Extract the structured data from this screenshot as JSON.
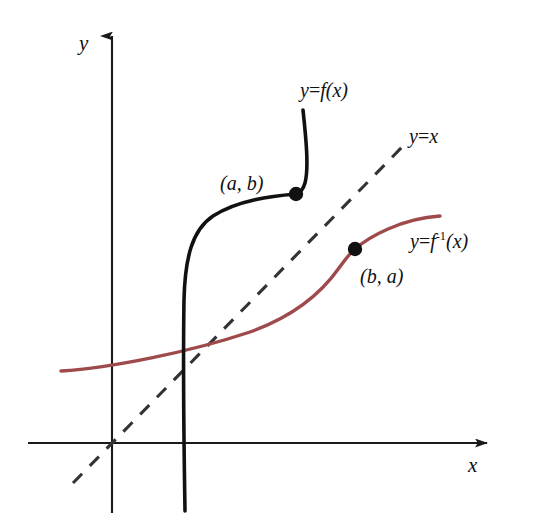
{
  "figure": {
    "background_color": "#ffffff",
    "width": 543,
    "height": 523
  },
  "axes": {
    "x_label": "x",
    "y_label": "y",
    "axis_color": "#1a1a1a",
    "origin": {
      "x": 112,
      "y": 443
    }
  },
  "curves": {
    "function": {
      "label_prefix": "y",
      "label_equals": "=",
      "label_body": "f(x)",
      "label_full": "y=f(x)",
      "color": "#111111",
      "style": "solid"
    },
    "identity": {
      "label_prefix": "y",
      "label_equals": "=",
      "label_body": "x",
      "label_full": "y=x",
      "color": "#333333",
      "style": "dashed"
    },
    "inverse": {
      "label_prefix": "y",
      "label_equals": "=",
      "label_body_f": "f",
      "label_exponent": "-1",
      "label_body_x": "(x)",
      "label_full": "y=f-1(x)",
      "color": "#9e4a4a",
      "style": "solid"
    }
  },
  "points": [
    {
      "name": "point-a-b",
      "label": "(a, b)",
      "on_curve": "function",
      "x": 296,
      "y": 194,
      "color": "#111111"
    },
    {
      "name": "point-b-a",
      "label": "(b, a)",
      "on_curve": "inverse",
      "x": 355,
      "y": 249,
      "color": "#111111"
    }
  ]
}
